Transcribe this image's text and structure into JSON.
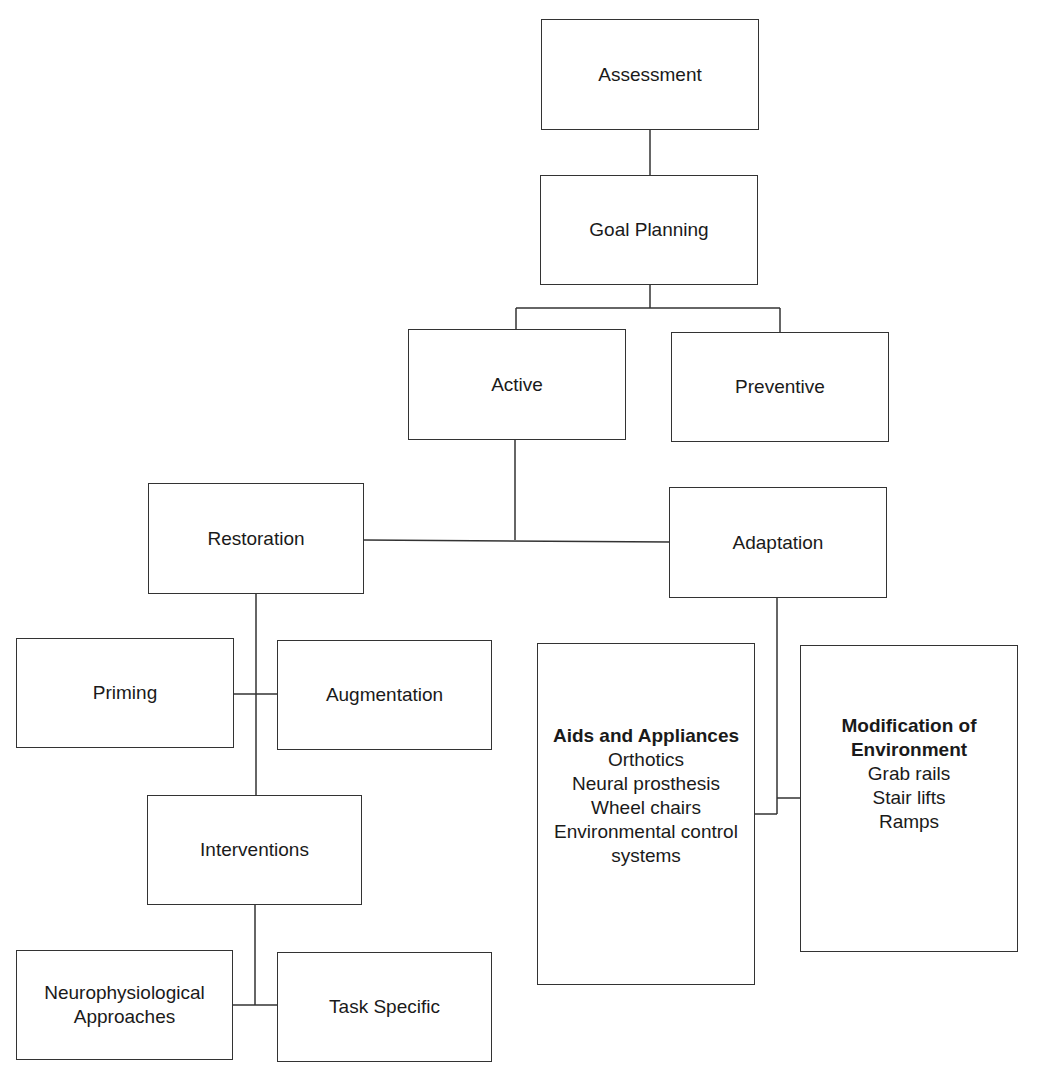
{
  "diagram": {
    "nodes": {
      "assessment": "Assessment",
      "goal_planning": "Goal Planning",
      "active": "Active",
      "preventive": "Preventive",
      "restoration": "Restoration",
      "adaptation": "Adaptation",
      "priming": "Priming",
      "augmentation": "Augmentation",
      "interventions": "Interventions",
      "neuro_line1": "Neurophysiological",
      "neuro_line2": "Approaches",
      "task_specific": "Task Specific",
      "aids": {
        "title": "Aids and Appliances",
        "items": [
          "Orthotics",
          "Neural prosthesis",
          "Wheel chairs",
          "Environmental control",
          "systems"
        ]
      },
      "modification": {
        "title_line1": "Modification of",
        "title_line2": "Environment",
        "items": [
          "Grab rails",
          "Stair lifts",
          "Ramps"
        ]
      }
    },
    "edges": [
      [
        "Assessment",
        "Goal Planning"
      ],
      [
        "Goal Planning",
        "Active"
      ],
      [
        "Goal Planning",
        "Preventive"
      ],
      [
        "Active",
        "Restoration"
      ],
      [
        "Active",
        "Adaptation"
      ],
      [
        "Restoration",
        "Priming"
      ],
      [
        "Restoration",
        "Augmentation"
      ],
      [
        "Restoration",
        "Interventions"
      ],
      [
        "Interventions",
        "Neurophysiological Approaches"
      ],
      [
        "Interventions",
        "Task Specific"
      ],
      [
        "Adaptation",
        "Aids and Appliances"
      ],
      [
        "Adaptation",
        "Modification of Environment"
      ]
    ],
    "colors": {
      "stroke": "#333333",
      "background": "#ffffff",
      "text": "#1a1a1a"
    }
  }
}
